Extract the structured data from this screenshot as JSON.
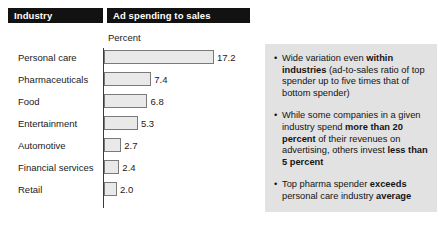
{
  "headers": {
    "industry": "Industry",
    "ad_spending": "Ad spending to sales"
  },
  "axis_caption": "Percent",
  "chart_data": {
    "type": "bar",
    "orientation": "horizontal",
    "title": "Ad spending to sales",
    "xlabel": "Percent",
    "ylabel": "Industry",
    "categories": [
      "Personal care",
      "Pharmaceuticals",
      "Food",
      "Entertainment",
      "Automotive",
      "Financial services",
      "Retail"
    ],
    "values": [
      17.2,
      7.4,
      6.8,
      5.3,
      2.7,
      2.4,
      2.0
    ],
    "value_labels": [
      "17.2",
      "7.4",
      "6.8",
      "5.3",
      "2.7",
      "2.4",
      "2.0"
    ],
    "xlim": [
      0,
      17.2
    ],
    "grid": false,
    "legend": false,
    "bar_fill_color": "#e9e9e9",
    "bar_border_color": "#7a7a7a",
    "axis_color": "#3a3a3a"
  },
  "callout": {
    "background_color": "#e2e2e2",
    "bullets": [
      [
        {
          "text": "Wide variation even ",
          "bold": false
        },
        {
          "text": "within industries",
          "bold": true
        },
        {
          "text": " (ad-to-sales ratio of top spender up to five times that of bottom spender)",
          "bold": false
        }
      ],
      [
        {
          "text": "While some companies in a given industry spend ",
          "bold": false
        },
        {
          "text": "more than 20 percent",
          "bold": true
        },
        {
          "text": " of their revenues on advertising, others invest ",
          "bold": false
        },
        {
          "text": "less than 5 percent",
          "bold": true
        }
      ],
      [
        {
          "text": "Top pharma spender ",
          "bold": false
        },
        {
          "text": "exceeds",
          "bold": true
        },
        {
          "text": " personal care industry ",
          "bold": false
        },
        {
          "text": "average",
          "bold": true
        }
      ]
    ]
  }
}
